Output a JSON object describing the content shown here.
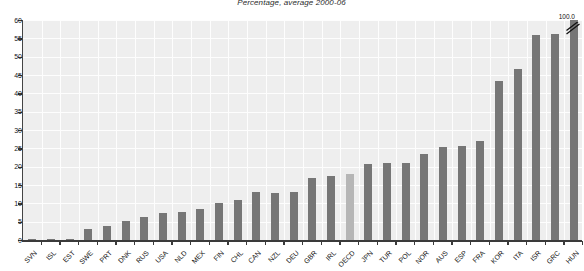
{
  "chart": {
    "title": "Percentage, average 2000-06",
    "value_label_top": "100.0",
    "colors": {
      "bar": "#767676",
      "bar_highlight": "#b6b6b6",
      "plot_background": "#eeeeee",
      "gridline": "#fdfdfd",
      "axis": "#3a3a3a"
    }
  },
  "chart_data": {
    "type": "bar",
    "title": "Percentage, average 2000-06",
    "xlabel": "",
    "ylabel": "",
    "ylim": [
      0,
      60
    ],
    "yticks": [
      0,
      5,
      10,
      15,
      20,
      25,
      30,
      35,
      40,
      45,
      50,
      55,
      60
    ],
    "grid": true,
    "legend": "none",
    "highlight_category": "OECD",
    "truncated_bars": [
      {
        "category": "HUN",
        "actual_value": 100.0,
        "displayed_label": "100.0"
      }
    ],
    "categories": [
      "SVN",
      "ISL",
      "EST",
      "SWE",
      "PRT",
      "DNK",
      "RUS",
      "USA",
      "NLD",
      "MEX",
      "FIN",
      "CHL",
      "CAN",
      "NZL",
      "DEU",
      "GBR",
      "IRL",
      "OECD",
      "JPN",
      "TUR",
      "POL",
      "NOR",
      "AUS",
      "ESP",
      "FRA",
      "KOR",
      "ITA",
      "ISR",
      "GRC",
      "HUN"
    ],
    "values": [
      0.1,
      0.3,
      0.4,
      2.9,
      3.7,
      5.1,
      6.4,
      7.5,
      7.7,
      8.5,
      10.1,
      10.9,
      13.0,
      12.9,
      13.1,
      16.9,
      17.5,
      18.0,
      20.7,
      20.9,
      21.0,
      23.4,
      25.3,
      25.6,
      27.1,
      43.3,
      46.7,
      56.0,
      56.3,
      100.0
    ]
  }
}
